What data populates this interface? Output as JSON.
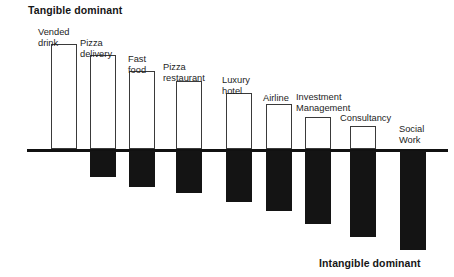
{
  "annotations": {
    "top_left": "Tangible dominant",
    "bottom_right": "Intangible dominant"
  },
  "colors": {
    "tangible_fill": "#ffffff",
    "tangible_stroke": "#3a3a3a",
    "intangible_fill": "#141414",
    "axis": "#111111",
    "text": "#1a1a1a"
  },
  "chart_data": {
    "type": "bar",
    "title": "",
    "subtitle": "",
    "xlabel": "",
    "ylabel": "",
    "orientation": "vertical",
    "grid": false,
    "legend": null,
    "axis_baseline": 0,
    "annotations": [
      {
        "text": "Tangible dominant",
        "position": "top-left"
      },
      {
        "text": "Intangible dominant",
        "position": "bottom-right"
      }
    ],
    "categories": [
      "Vended drink",
      "Pizza delivery",
      "Fast food",
      "Pizza restaurant",
      "Luxury hotel",
      "Airline",
      "Investment Management",
      "Consultancy",
      "Social Work"
    ],
    "series": [
      {
        "name": "Tangible",
        "color": "#ffffff",
        "values": [
          105,
          95,
          78,
          68,
          55,
          45,
          32,
          23,
          0
        ]
      },
      {
        "name": "Intangible",
        "color": "#141414",
        "values": [
          0,
          26,
          0,
          36,
          0,
          51,
          0,
          66,
          0
        ]
      }
    ],
    "ylim": [
      -130,
      110
    ]
  },
  "bars": [
    {
      "id": "vended-drink",
      "label": "Vended\ndrink",
      "x": 51,
      "width": 26,
      "tangible_height": 105,
      "intangible_height": 0,
      "label_x": 38,
      "label_y": 27
    },
    {
      "id": "pizza-delivery",
      "label": "Pizza\ndelivery",
      "x": 90,
      "width": 26,
      "tangible_height": 94,
      "intangible_height": 26,
      "label_x": 80,
      "label_y": 38
    },
    {
      "id": "fast-food",
      "label": "Fast\nfood",
      "x": 129,
      "width": 26,
      "tangible_height": 78,
      "intangible_height": 36,
      "label_x": 128,
      "label_y": 54
    },
    {
      "id": "pizza-restaurant",
      "label": "Pizza\nrestaurant",
      "x": 176,
      "width": 26,
      "tangible_height": 68,
      "intangible_height": 42,
      "label_x": 163,
      "label_y": 62
    },
    {
      "id": "luxury-hotel",
      "label": "Luxury\nhotel",
      "x": 226,
      "width": 26,
      "tangible_height": 56,
      "intangible_height": 51,
      "label_x": 222,
      "label_y": 75
    },
    {
      "id": "airline",
      "label": "Airline",
      "x": 266,
      "width": 26,
      "tangible_height": 45,
      "intangible_height": 60,
      "label_x": 263,
      "label_y": 93
    },
    {
      "id": "investment-management",
      "label": "Investment\nManagement",
      "x": 305,
      "width": 26,
      "tangible_height": 32,
      "intangible_height": 73,
      "label_x": 296,
      "label_y": 92
    },
    {
      "id": "consultancy",
      "label": "Consultancy",
      "x": 350,
      "width": 26,
      "tangible_height": 23,
      "intangible_height": 86,
      "label_x": 340,
      "label_y": 113
    },
    {
      "id": "social-work",
      "label": "Social\nWork",
      "x": 400,
      "width": 26,
      "tangible_height": 0,
      "intangible_height": 99,
      "label_x": 399,
      "label_y": 124
    }
  ]
}
